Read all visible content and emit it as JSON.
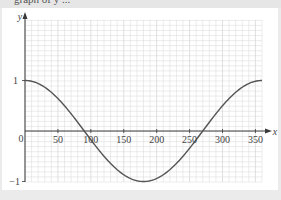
{
  "header": {
    "cut_text": "graph of y ..."
  },
  "chart_data": {
    "type": "line",
    "title": "",
    "xlabel": "x",
    "ylabel": "y",
    "function": "y = cos x",
    "x": [
      0,
      30,
      60,
      90,
      120,
      150,
      180,
      210,
      240,
      270,
      300,
      330,
      360
    ],
    "series": [
      {
        "name": "y = cos x",
        "values": [
          1,
          0.866,
          0.5,
          0,
          -0.5,
          -0.866,
          -1,
          -0.866,
          -0.5,
          0,
          0.5,
          0.866,
          1
        ]
      }
    ],
    "xlim": [
      0,
      360
    ],
    "ylim": [
      -1,
      1
    ],
    "x_ticks": [
      "50",
      "100",
      "150",
      "200",
      "250",
      "300",
      "350"
    ],
    "y_ticks": [
      "1",
      "-1"
    ],
    "origin_label": "0",
    "grid": true,
    "legend": "none"
  },
  "colors": {
    "grid": "#d8d8d8",
    "axis": "#3a3a3a",
    "curve": "#555555",
    "background": "#ffffff",
    "page": "#ebebeb"
  }
}
